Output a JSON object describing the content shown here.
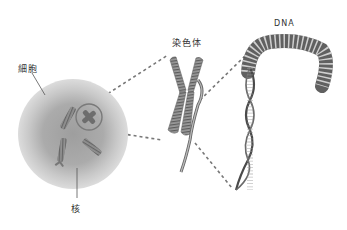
{
  "diagram": {
    "type": "cell-to-dna-zoom",
    "labels": {
      "cell": "細胞",
      "nucleus": "核",
      "chromosome": "染色体",
      "dna": "DNA"
    },
    "colors": {
      "cell_outer": "#d6d6d6",
      "cell_inner": "#a9a9a9",
      "chromosome": "#8a8a8a",
      "chromosome_dark": "#555555",
      "dna": "#444444",
      "dna_light": "#bdbdbd",
      "dashed_line": "#777777",
      "label_text": "#333333",
      "highlight_circle": "#7a7a7a"
    }
  }
}
